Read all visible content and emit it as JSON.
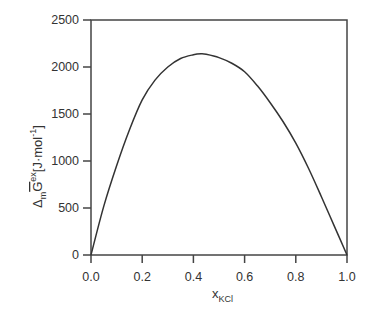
{
  "chart_data": {
    "type": "line",
    "title": "",
    "xlabel": "x_KCl",
    "xlabel_main": "x",
    "xlabel_sub": "KCl",
    "ylabel": "Δ_m G̅^ex [J·mol⁻¹]",
    "ylabel_parts": {
      "delta": "Δ",
      "delta_sub": "m",
      "symbol": "G",
      "sup": "ex",
      "unit": "[J·mol",
      "unit_sup": "-1",
      "unit_close": "]"
    },
    "xlim": [
      0.0,
      1.0
    ],
    "ylim": [
      0,
      2500
    ],
    "x_ticks": [
      "0.0",
      "0.2",
      "0.4",
      "0.6",
      "0.8",
      "1.0"
    ],
    "y_ticks": [
      "0",
      "500",
      "1000",
      "1500",
      "2000",
      "2500"
    ],
    "grid": false,
    "legend": null,
    "series": [
      {
        "name": "excess Gibbs energy of mixing",
        "color": "#333333",
        "x": [
          0.0,
          0.05,
          0.1,
          0.15,
          0.2,
          0.25,
          0.3,
          0.35,
          0.4,
          0.43,
          0.45,
          0.5,
          0.55,
          0.6,
          0.65,
          0.7,
          0.75,
          0.8,
          0.85,
          0.9,
          0.95,
          1.0
        ],
        "y": [
          0,
          520,
          950,
          1330,
          1650,
          1860,
          2000,
          2090,
          2130,
          2140,
          2135,
          2100,
          2040,
          1950,
          1800,
          1620,
          1420,
          1190,
          920,
          620,
          310,
          0
        ]
      }
    ]
  }
}
